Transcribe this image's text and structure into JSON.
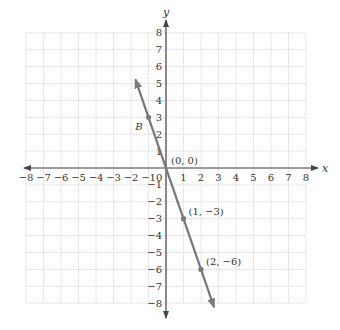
{
  "chart_data": {
    "type": "line",
    "title": "",
    "xlabel": "x",
    "ylabel": "y",
    "xlim": [
      -8,
      8
    ],
    "ylim": [
      -8,
      8
    ],
    "grid": true,
    "x_ticks": [
      -8,
      -7,
      -6,
      -5,
      -4,
      -3,
      -2,
      -1,
      1,
      2,
      3,
      4,
      5,
      6,
      7,
      8
    ],
    "y_ticks": [
      -8,
      -7,
      -6,
      -5,
      -4,
      -3,
      -2,
      -1,
      1,
      2,
      3,
      4,
      5,
      6,
      7,
      8
    ],
    "x_tick_labels": [
      "−8",
      "−7",
      "−6",
      "−5",
      "−4",
      "−3",
      "−2",
      "−1",
      "1",
      "2",
      "3",
      "4",
      "5",
      "6",
      "7",
      "8"
    ],
    "y_tick_labels": [
      "−8",
      "−7",
      "−6",
      "−5",
      "−4",
      "−3",
      "−2",
      "−1",
      "1",
      "2",
      "3",
      "4",
      "5",
      "6",
      "7",
      "8"
    ],
    "origin_label": "0",
    "series": [
      {
        "name": "y = -3x",
        "slope": -3,
        "intercept": 0,
        "line_x_range": [
          -1.75,
          2.75
        ],
        "color": "#777777",
        "arrows": "both"
      }
    ],
    "points": [
      {
        "x": -1,
        "y": 3,
        "label": "B",
        "label_style": "italic",
        "label_pos": "left-below"
      },
      {
        "x": 0,
        "y": 0,
        "label": "(0, 0)",
        "label_pos": "right-above"
      },
      {
        "x": 1,
        "y": -3,
        "label": "(1, −3)",
        "label_pos": "right-above"
      },
      {
        "x": 2,
        "y": -6,
        "label": "(2, −6)",
        "label_pos": "right-above"
      }
    ]
  },
  "colors": {
    "axis": "#444444",
    "grid": "#cfcfcf",
    "line": "#7a7a7a",
    "point": "#7a7a7a",
    "text": "#333333"
  }
}
